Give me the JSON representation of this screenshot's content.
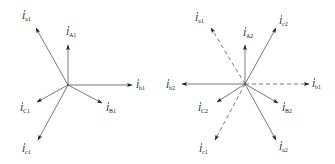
{
  "diagrams": [
    {
      "name": "positive-sequence-phasors",
      "origin": [
        68,
        85
      ],
      "vectors": [
        {
          "id": "Ia1",
          "base": "I",
          "sub": "a1",
          "end": [
            36,
            28
          ],
          "label": [
            22,
            19
          ],
          "dashed": false
        },
        {
          "id": "IA1",
          "base": "I",
          "sub": "A1",
          "end": [
            68,
            45
          ],
          "label": [
            66,
            35
          ],
          "dashed": false
        },
        {
          "id": "Ib1",
          "base": "I",
          "sub": "b1",
          "end": [
            132,
            85
          ],
          "label": [
            136,
            88
          ],
          "dashed": false
        },
        {
          "id": "IB1",
          "base": "I",
          "sub": "B1",
          "end": [
            102,
            103
          ],
          "label": [
            106,
            111
          ],
          "dashed": false
        },
        {
          "id": "IC1",
          "base": "I",
          "sub": "C1",
          "end": [
            37,
            102
          ],
          "label": [
            20,
            111
          ],
          "dashed": false
        },
        {
          "id": "Ic1",
          "base": "I",
          "sub": "c1",
          "end": [
            38,
            140
          ],
          "label": [
            22,
            152
          ],
          "dashed": false
        }
      ]
    },
    {
      "name": "negative-sequence-phasors",
      "origin": [
        245,
        84
      ],
      "vectors": [
        {
          "id": "Ia1",
          "base": "I",
          "sub": "a1",
          "end": [
            211,
            28
          ],
          "label": [
            195,
            21
          ],
          "dashed": true
        },
        {
          "id": "IA2",
          "base": "I",
          "sub": "A2",
          "end": [
            245,
            45
          ],
          "label": [
            243,
            36
          ],
          "dashed": false
        },
        {
          "id": "Ic2",
          "base": "I",
          "sub": "c2",
          "end": [
            276,
            28
          ],
          "label": [
            279,
            24
          ],
          "dashed": false
        },
        {
          "id": "Ib2",
          "base": "I",
          "sub": "b2",
          "end": [
            182,
            84
          ],
          "label": [
            166,
            88
          ],
          "dashed": false
        },
        {
          "id": "Ib1",
          "base": "I",
          "sub": "b1",
          "end": [
            309,
            84
          ],
          "label": [
            312,
            87
          ],
          "dashed": true
        },
        {
          "id": "IC2",
          "base": "I",
          "sub": "C2",
          "end": [
            217,
            102
          ],
          "label": [
            198,
            111
          ],
          "dashed": false
        },
        {
          "id": "IB2",
          "base": "I",
          "sub": "B2",
          "end": [
            278,
            103
          ],
          "label": [
            282,
            111
          ],
          "dashed": false
        },
        {
          "id": "Ic1",
          "base": "I",
          "sub": "c1",
          "end": [
            215,
            140
          ],
          "label": [
            199,
            152
          ],
          "dashed": true
        },
        {
          "id": "Ia2",
          "base": "I",
          "sub": "a2",
          "end": [
            276,
            140
          ],
          "label": [
            279,
            150
          ],
          "dashed": false
        }
      ]
    }
  ],
  "colors": {
    "line": "#555555",
    "text": "#222222",
    "background": "#ffffff"
  }
}
